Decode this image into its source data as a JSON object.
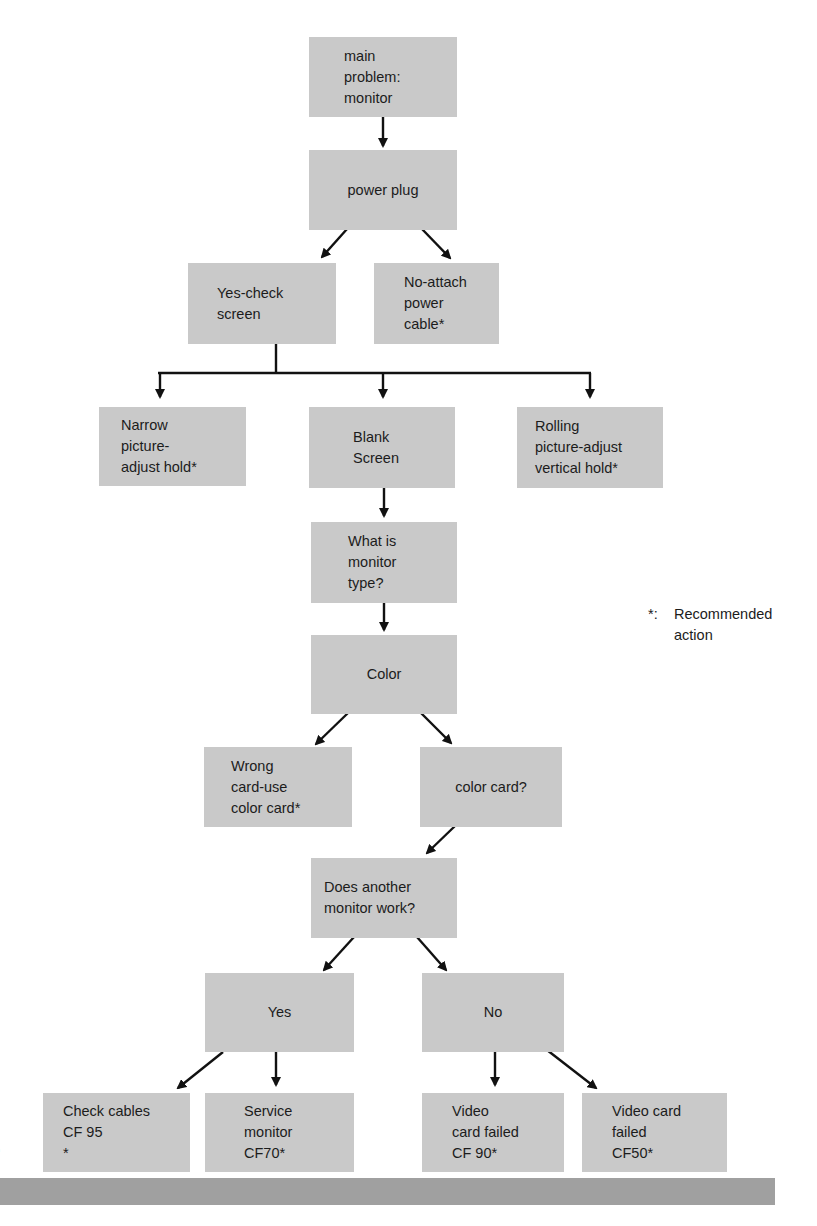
{
  "diagram": {
    "type": "troubleshooting-flowchart",
    "colors": {
      "box_fill": "#c9c9c9",
      "arrow": "#111111",
      "footer_bar": "#a0a0a0"
    },
    "nodes": {
      "root": "main\nproblem:\nmonitor",
      "power_plug": "power plug",
      "yes_check_screen": "Yes-check\nscreen",
      "no_attach_power": "No-attach\npower\ncable*",
      "narrow_picture": "Narrow\npicture-\nadjust hold*",
      "blank_screen": "Blank\nScreen",
      "rolling_picture": "Rolling\npicture-adjust\nvertical hold*",
      "monitor_type": "What is\nmonitor\ntype?",
      "color": "Color",
      "wrong_card": "Wrong\ncard-use\ncolor card*",
      "color_card": "color card?",
      "another_monitor": "Does another\nmonitor work?",
      "yes": "Yes",
      "no": "No",
      "check_cables": "Check cables\nCF 95\n*",
      "service_monitor": "Service\nmonitor\nCF70*",
      "video_card_failed_90": "Video\ncard failed\nCF 90*",
      "video_card_failed_50": "Video card\nfailed\nCF50*"
    },
    "edges": [
      [
        "root",
        "power_plug"
      ],
      [
        "power_plug",
        "yes_check_screen"
      ],
      [
        "power_plug",
        "no_attach_power"
      ],
      [
        "yes_check_screen",
        "narrow_picture"
      ],
      [
        "yes_check_screen",
        "blank_screen"
      ],
      [
        "yes_check_screen",
        "rolling_picture"
      ],
      [
        "blank_screen",
        "monitor_type"
      ],
      [
        "monitor_type",
        "color"
      ],
      [
        "color",
        "wrong_card"
      ],
      [
        "color",
        "color_card"
      ],
      [
        "color_card",
        "another_monitor"
      ],
      [
        "another_monitor",
        "yes"
      ],
      [
        "another_monitor",
        "no"
      ],
      [
        "yes",
        "check_cables"
      ],
      [
        "yes",
        "service_monitor"
      ],
      [
        "no",
        "video_card_failed_90"
      ],
      [
        "no",
        "video_card_failed_50"
      ]
    ],
    "legend": {
      "symbol": "*:",
      "text": "Recommended\naction"
    },
    "margin_mark": ")"
  }
}
